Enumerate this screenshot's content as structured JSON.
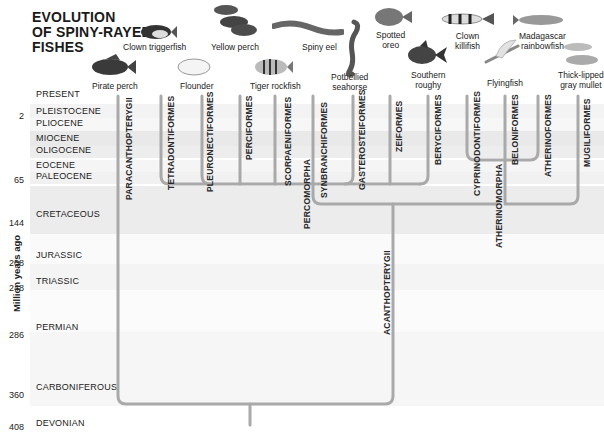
{
  "title": {
    "line1": "EVOLUTION",
    "line2": "OF SPINY-RAYED",
    "line3": "FISHES"
  },
  "y_axis_label": "Million years ago",
  "periods": [
    {
      "name": "PRESENT",
      "age": ""
    },
    {
      "name": "PLEISTOCENE",
      "age": "2"
    },
    {
      "name": "PLIOCENE",
      "age": ""
    },
    {
      "name": "MIOCENE",
      "age": ""
    },
    {
      "name": "OLIGOCENE",
      "age": ""
    },
    {
      "name": "EOCENE",
      "age": ""
    },
    {
      "name": "PALEOCENE",
      "age": "65"
    },
    {
      "name": "CRETACEOUS",
      "age": "144"
    },
    {
      "name": "JURASSIC",
      "age": "208"
    },
    {
      "name": "TRIASSIC",
      "age": "248"
    },
    {
      "name": "PERMIAN",
      "age": "286"
    },
    {
      "name": "CARBONIFEROUS",
      "age": "360"
    },
    {
      "name": "DEVONIAN",
      "age": "408"
    }
  ],
  "fishes": [
    {
      "name": "Clown triggerfish",
      "line1": "Clown triggerfish",
      "line2": ""
    },
    {
      "name": "Pirate perch",
      "line1": "Pirate perch",
      "line2": ""
    },
    {
      "name": "Yellow perch",
      "line1": "Yellow perch",
      "line2": ""
    },
    {
      "name": "Flounder",
      "line1": "Flounder",
      "line2": ""
    },
    {
      "name": "Spiny eel",
      "line1": "Spiny eel",
      "line2": ""
    },
    {
      "name": "Tiger rockfish",
      "line1": "Tiger rockfish",
      "line2": ""
    },
    {
      "name": "Potbellied seahorse",
      "line1": "Potbellied",
      "line2": "seahorse"
    },
    {
      "name": "Spotted oreo",
      "line1": "Spotted",
      "line2": "oreo"
    },
    {
      "name": "Southern roughy",
      "line1": "Southern",
      "line2": "roughy"
    },
    {
      "name": "Clown killifish",
      "line1": "Clown",
      "line2": "killifish"
    },
    {
      "name": "Flyingfish",
      "line1": "Flyingfish",
      "line2": ""
    },
    {
      "name": "Madagascar rainbowfish",
      "line1": "Madagascar",
      "line2": "rainbowfish"
    },
    {
      "name": "Thick-lipped gray mullet",
      "line1": "Thick-lipped",
      "line2": "gray mullet"
    }
  ],
  "clades": {
    "orders": [
      "PARACANTHOPTERYGII",
      "TETRADONTIFORMES",
      "PLEURONECTIFORMES",
      "PERCIFORMES",
      "SCORPAENIFORMES",
      "SYNBRANCHIFORMES",
      "GASTEROSTEIFORMES",
      "ZEIFORMES",
      "BERYCIFORMES",
      "CYPRINODONTIFORMES",
      "BELONIFORMES",
      "ATHERINOFORMES",
      "MUGILIFORMES"
    ],
    "groups": [
      "PERCOMORPHA",
      "ATHERINOMORPHA",
      "ACANTHOPTERYGII"
    ]
  },
  "colors": {
    "line": "#a9a9a9",
    "band_dark": "#e6e6e6",
    "band_light": "#f1f1f1",
    "band_white": "#fbfbfb",
    "text": "#222222"
  }
}
